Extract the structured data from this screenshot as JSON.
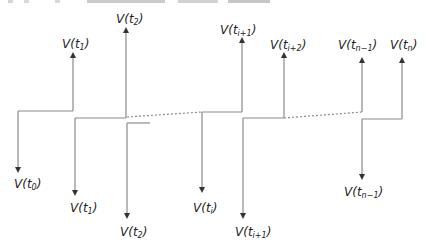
{
  "diagram": {
    "line_color": "#8a8a8a",
    "arrow_color": "#333333",
    "label_color": "#222222",
    "up_labels": [
      {
        "id": "t1",
        "base": "V(",
        "sub": "t",
        "idx": "1",
        "close": ")",
        "x": 62,
        "y": 48
      },
      {
        "id": "t2",
        "base": "V(",
        "sub": "t",
        "idx": "2",
        "close": ")",
        "x": 116,
        "y": 23
      },
      {
        "id": "ti1",
        "base": "V(",
        "sub": "t",
        "idx": "i+1",
        "close": ")",
        "x": 220,
        "y": 34
      },
      {
        "id": "ti2",
        "base": "V(",
        "sub": "t",
        "idx": "i+2",
        "close": ")",
        "x": 270,
        "y": 49
      },
      {
        "id": "tn1",
        "base": "V(",
        "sub": "t",
        "idx": "n−1",
        "close": ")",
        "x": 338,
        "y": 49
      },
      {
        "id": "tn",
        "base": "V(",
        "sub": "t",
        "idx": "n",
        "close": ")",
        "x": 390,
        "y": 49
      }
    ],
    "down_labels": [
      {
        "id": "t0",
        "base": "V(",
        "sub": "t",
        "idx": "0",
        "close": ")",
        "x": 14,
        "y": 188
      },
      {
        "id": "t1",
        "base": "V(",
        "sub": "t",
        "idx": "1",
        "close": ")",
        "x": 70,
        "y": 212
      },
      {
        "id": "t2",
        "base": "V(",
        "sub": "t",
        "idx": "2",
        "close": ")",
        "x": 120,
        "y": 236
      },
      {
        "id": "ti",
        "base": "V(",
        "sub": "t",
        "idx": "i",
        "close": ")",
        "x": 193,
        "y": 212
      },
      {
        "id": "ti1",
        "base": "V(",
        "sub": "t",
        "idx": "i+1",
        "close": ")",
        "x": 235,
        "y": 236
      },
      {
        "id": "tn1",
        "base": "V(",
        "sub": "t",
        "idx": "n−1",
        "close": ")",
        "x": 344,
        "y": 196
      }
    ]
  }
}
